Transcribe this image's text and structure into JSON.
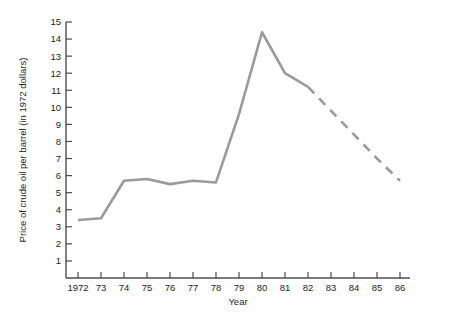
{
  "chart_data": {
    "type": "line",
    "title": "",
    "xlabel": "Year",
    "ylabel": "Price of crude oil per barrel (in 1972 dollars)",
    "x": [
      1972,
      1973,
      1974,
      1975,
      1976,
      1977,
      1978,
      1979,
      1980,
      1981,
      1982,
      1983,
      1984,
      1985,
      1986
    ],
    "xtick_labels": [
      "1972",
      "73",
      "74",
      "75",
      "76",
      "77",
      "78",
      "79",
      "80",
      "81",
      "82",
      "83",
      "84",
      "85",
      "86"
    ],
    "ytick_labels": [
      "1",
      "2",
      "3",
      "4",
      "5",
      "6",
      "7",
      "8",
      "9",
      "10",
      "11",
      "12",
      "13",
      "14",
      "15"
    ],
    "ytick_values": [
      1,
      2,
      3,
      4,
      5,
      6,
      7,
      8,
      9,
      10,
      11,
      12,
      13,
      14,
      15
    ],
    "xlim": [
      1972,
      1986
    ],
    "ylim": [
      0,
      15
    ],
    "grid": false,
    "legend": null,
    "series": [
      {
        "name": "Actual price",
        "style": "solid",
        "color": "#9a9a9a",
        "x": [
          1972,
          1973,
          1974,
          1975,
          1976,
          1977,
          1978,
          1979,
          1980,
          1981,
          1982
        ],
        "values": [
          3.4,
          3.5,
          5.7,
          5.8,
          5.5,
          5.7,
          5.6,
          9.6,
          14.4,
          12.0,
          11.2
        ]
      },
      {
        "name": "Projected price",
        "style": "dashed",
        "color": "#9a9a9a",
        "x": [
          1982,
          1983,
          1984,
          1985,
          1986
        ],
        "values": [
          11.2,
          9.8,
          8.4,
          7.0,
          5.7
        ]
      }
    ]
  },
  "axes": {
    "y_axis_title": "Price of crude oil per barrel (in 1972 dollars)",
    "x_axis_title": "Year"
  }
}
